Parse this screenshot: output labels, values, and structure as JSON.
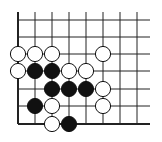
{
  "board": {
    "columns_x": [
      18,
      35,
      52,
      69,
      86,
      103,
      120,
      137
    ],
    "rows_y": [
      20,
      37,
      54,
      71,
      89,
      106,
      124
    ],
    "top_extent": 12,
    "right_extent": 150,
    "edges": {
      "left": true,
      "bottom": true,
      "top": false,
      "right": false
    },
    "line_color": "#222222",
    "stone_radius": 7.6
  },
  "stones": [
    {
      "color": "white",
      "col": 0,
      "row": 2
    },
    {
      "color": "white",
      "col": 1,
      "row": 2
    },
    {
      "color": "white",
      "col": 2,
      "row": 2
    },
    {
      "color": "white",
      "col": 5,
      "row": 2
    },
    {
      "color": "white",
      "col": 0,
      "row": 3
    },
    {
      "color": "black",
      "col": 1,
      "row": 3
    },
    {
      "color": "black",
      "col": 2,
      "row": 3
    },
    {
      "color": "white",
      "col": 3,
      "row": 3
    },
    {
      "color": "white",
      "col": 4,
      "row": 3
    },
    {
      "color": "black",
      "col": 2,
      "row": 4
    },
    {
      "color": "black",
      "col": 3,
      "row": 4
    },
    {
      "color": "black",
      "col": 4,
      "row": 4
    },
    {
      "color": "white",
      "col": 5,
      "row": 4
    },
    {
      "color": "black",
      "col": 1,
      "row": 5
    },
    {
      "color": "white",
      "col": 2,
      "row": 5
    },
    {
      "color": "white",
      "col": 5,
      "row": 5
    },
    {
      "color": "white",
      "col": 2,
      "row": 6
    },
    {
      "color": "black",
      "col": 3,
      "row": 6
    }
  ]
}
